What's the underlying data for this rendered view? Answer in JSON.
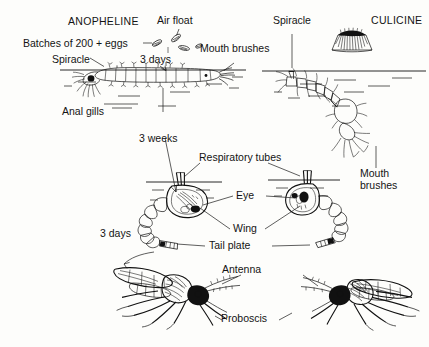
{
  "figure": {
    "type": "diagram",
    "background_color": "#fdfdfb",
    "ink_color": "#111111"
  },
  "headings": {
    "left": "ANOPHELINE",
    "right": "CULICINE"
  },
  "labels": {
    "air_float": "Air float",
    "batches": "Batches of 200 + eggs",
    "spiracle_left": "Spiracle",
    "spiracle_right": "Spiracle",
    "mouth_brushes_left": "Mouth brushes",
    "mouth_brushes_right": "Mouth\nbrushes",
    "anal_gills": "Anal gills",
    "respiratory_tubes": "Respiratory tubes",
    "eye": "Eye",
    "wing": "Wing",
    "tail_plate": "Tail plate",
    "antenna": "Antenna",
    "proboscis": "Proboscis"
  },
  "durations": {
    "eggs_to_larva": "3 days",
    "larva_to_pupa": "3 weeks",
    "pupa_to_adult": "3 days"
  },
  "stages": [
    {
      "name": "eggs",
      "side": "anopheline",
      "description": "single boat-shaped eggs with air floats"
    },
    {
      "name": "egg-raft",
      "side": "culicine",
      "description": "rafts of eggs standing on water"
    },
    {
      "name": "larva",
      "side": "anopheline",
      "description": "larva lying parallel to water surface"
    },
    {
      "name": "larva",
      "side": "culicine",
      "description": "larva hanging at an angle from surface"
    },
    {
      "name": "pupa",
      "side": "anopheline",
      "description": "comma-shaped pupa with respiratory tubes"
    },
    {
      "name": "pupa",
      "side": "culicine",
      "description": "comma-shaped pupa with respiratory tubes"
    },
    {
      "name": "adult",
      "side": "anopheline",
      "description": "adult mosquito at rest"
    },
    {
      "name": "adult",
      "side": "culicine",
      "description": "adult mosquito at rest"
    }
  ]
}
